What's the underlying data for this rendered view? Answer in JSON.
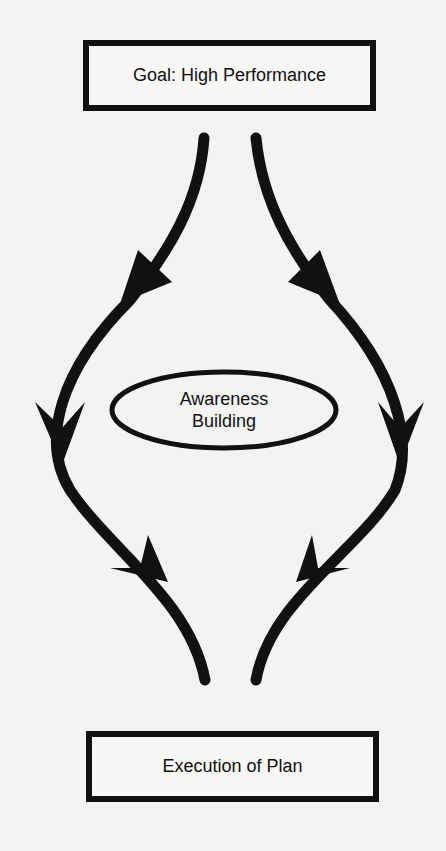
{
  "diagram": {
    "top_node": {
      "label": "Goal: High Performance",
      "shape": "rectangle"
    },
    "center_node": {
      "line1": "Awareness",
      "line2": "Building",
      "shape": "ellipse"
    },
    "bottom_node": {
      "label": "Execution of Plan",
      "shape": "rectangle"
    },
    "paths": [
      {
        "name": "left-path",
        "from": "Goal: High Performance",
        "to": "Execution of Plan",
        "arrowheads": 3
      },
      {
        "name": "right-path",
        "from": "Goal: High Performance",
        "to": "Execution of Plan",
        "arrowheads": 3
      }
    ],
    "colors": {
      "ink": "#111111",
      "background": "#f3f3f1"
    }
  }
}
